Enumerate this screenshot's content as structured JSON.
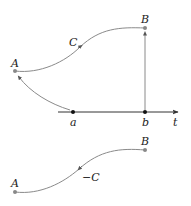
{
  "colors": {
    "curve": "#8a8a8a",
    "axis": "#333333",
    "point": "#888888",
    "text": "#222222"
  },
  "top_diagram": {
    "point_start_label": "A",
    "point_end_label": "B",
    "curve_label": "C",
    "axis_label": "t",
    "tick_a_label": "a",
    "tick_b_label": "b"
  },
  "bottom_diagram": {
    "point_start_label": "A",
    "point_end_label": "B",
    "curve_label": "−C"
  }
}
